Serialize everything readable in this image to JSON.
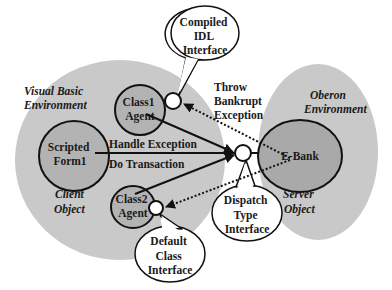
{
  "colors": {
    "background": "#ffffff",
    "environment_fill": "#c9c9c9",
    "object_fill": "#a9a9a9",
    "stroke": "#111111",
    "bubble_fill": "#ffffff"
  },
  "environments": {
    "client": {
      "line1": "Visual Basic",
      "line2": "Environment"
    },
    "server": {
      "line1": "Oberon",
      "line2": "Environment"
    }
  },
  "object_labels": {
    "client": {
      "line1": "Client",
      "line2": "Object"
    },
    "server": {
      "line1": "Server",
      "line2": "Object"
    }
  },
  "nodes": {
    "class1_agent": {
      "line1": "Class1",
      "line2": "Agent"
    },
    "scripted_form1": {
      "line1": "Scripted",
      "line2": "Form1"
    },
    "class2_agent": {
      "line1": "Class2",
      "line2": "Agent"
    },
    "ebank": {
      "label": "E-Bank"
    }
  },
  "callouts": {
    "compiled_idl": {
      "line1": "Compiled",
      "line2": "IDL",
      "line3": "Interface"
    },
    "dispatch_type": {
      "line1": "Dispatch",
      "line2": "Type",
      "line3": "Interface"
    },
    "default_class": {
      "line1": "Default",
      "line2": "Class",
      "line3": "Interface"
    }
  },
  "edges": {
    "throw_bankrupt": {
      "line1": "Throw",
      "line2": "Bankrupt",
      "line3": "Exception"
    },
    "handle_exception": {
      "label": "Handle Exception"
    },
    "do_transaction": {
      "label": "Do Transaction"
    }
  }
}
